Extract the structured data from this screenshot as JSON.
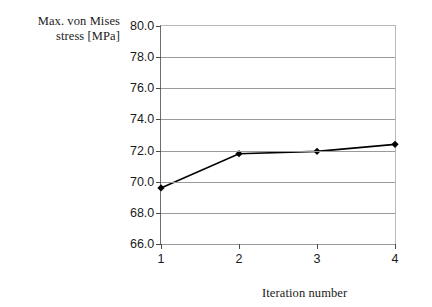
{
  "chart_data": {
    "type": "line",
    "title": "",
    "xlabel": "Iteration number",
    "ylabel": "Max. von Mises\nstress [MPa]",
    "x": [
      1,
      2,
      3,
      4
    ],
    "values": [
      69.6,
      71.8,
      71.95,
      72.4
    ],
    "series": [
      {
        "name": "Max. von Mises stress",
        "values": [
          69.6,
          71.8,
          71.95,
          72.4
        ]
      }
    ],
    "categories": [
      "1",
      "2",
      "3",
      "4"
    ],
    "xtick_labels": [
      "1",
      "2",
      "3",
      "4"
    ],
    "ytick_labels": [
      "80.0",
      "78.0",
      "76.0",
      "74.0",
      "72.0",
      "70.0",
      "68.0",
      "66.0"
    ],
    "ytick_values": [
      80.0,
      78.0,
      76.0,
      74.0,
      72.0,
      70.0,
      68.0,
      66.0
    ],
    "ylim": [
      66.0,
      80.0
    ],
    "xlim": [
      1,
      4
    ],
    "grid": "horizontal",
    "legend": "none",
    "marker": "diamond",
    "line_color": "#000000",
    "marker_color": "#000000",
    "grid_color": "#9a9a9a",
    "axis_color": "#6d6d6d",
    "background": "#ffffff"
  }
}
